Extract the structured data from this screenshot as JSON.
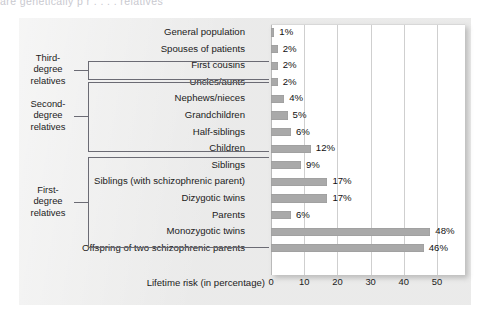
{
  "top_cut_text": "are genetically  p  r  . . . . relatives",
  "chart_data": {
    "type": "bar",
    "title": "",
    "xlabel": "Lifetime risk (in percentage)",
    "ylabel": "",
    "orientation": "horizontal",
    "xlim": [
      0,
      60
    ],
    "xticks": [
      0,
      10,
      20,
      30,
      40,
      50
    ],
    "xtick_labels": [
      "0",
      "10",
      "20",
      "30",
      "40",
      "50"
    ],
    "grid": "vertical",
    "legend": "none",
    "value_suffix": "%",
    "categories": [
      "General population",
      "Spouses of patients",
      "First cousins",
      "Uncles/aunts",
      "Nephews/nieces",
      "Grandchildren",
      "Half-siblings",
      "Children",
      "Siblings",
      "Siblings (with schizophrenic parent)",
      "Dizygotic twins",
      "Parents",
      "Monozygotic twins",
      "Offspring of two schizophrenic parents"
    ],
    "values": [
      1,
      2,
      2,
      2,
      4,
      5,
      6,
      12,
      9,
      17,
      17,
      6,
      48,
      46
    ],
    "value_labels": [
      "1%",
      "2%",
      "2%",
      "2%",
      "4%",
      "5%",
      "6%",
      "12%",
      "9%",
      "17%",
      "17%",
      "6%",
      "48%",
      "46%"
    ],
    "bar_color": "#a9a9a9",
    "plot_background": "#ffffff",
    "panel_background": "#f1f1f0",
    "annotations": [
      {
        "label": "Third-\ndegree\nrelatives",
        "covers": [
          "Spouses of patients",
          "First cousins"
        ]
      },
      {
        "label": "Second-\ndegree\nrelatives",
        "covers": [
          "Uncles/aunts",
          "Nephews/nieces",
          "Grandchildren",
          "Half-siblings"
        ]
      },
      {
        "label": "First-\ndegree\nrelatives",
        "covers": [
          "Children",
          "Siblings",
          "Siblings (with schizophrenic parent)",
          "Dizygotic twins",
          "Parents"
        ]
      }
    ]
  },
  "groups": [
    {
      "name": "third-degree",
      "label": "Third-\ndegree\nrelatives"
    },
    {
      "name": "second-degree",
      "label": "Second-\ndegree\nrelatives"
    },
    {
      "name": "first-degree",
      "label": "First-\ndegree\nrelatives"
    }
  ]
}
